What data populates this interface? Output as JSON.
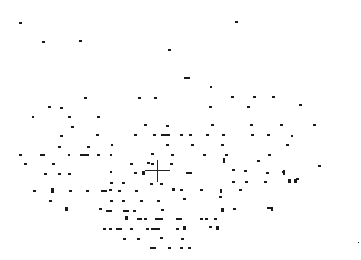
{
  "scene": {
    "background": "#ffffff",
    "mark_color": "#1a1a1a",
    "crosshair": {
      "x": 157,
      "y": 170,
      "arm": 12
    },
    "marks": [
      [
        19,
        22,
        3,
        2
      ],
      [
        42,
        41,
        3,
        2
      ],
      [
        79,
        40,
        3,
        2
      ],
      [
        235,
        21,
        3,
        2
      ],
      [
        168,
        49,
        3,
        2
      ],
      [
        184,
        77,
        6,
        2
      ],
      [
        210,
        86,
        2,
        2
      ],
      [
        84,
        97,
        3,
        2
      ],
      [
        138,
        97,
        3,
        2
      ],
      [
        154,
        97,
        3,
        2
      ],
      [
        231,
        96,
        3,
        2
      ],
      [
        253,
        96,
        3,
        2
      ],
      [
        272,
        96,
        3,
        2
      ],
      [
        48,
        106,
        3,
        2
      ],
      [
        60,
        107,
        3,
        2
      ],
      [
        68,
        116,
        3,
        2
      ],
      [
        97,
        116,
        3,
        2
      ],
      [
        209,
        106,
        3,
        2
      ],
      [
        247,
        106,
        3,
        2
      ],
      [
        299,
        104,
        3,
        2
      ],
      [
        32,
        116,
        2,
        2
      ],
      [
        71,
        126,
        3,
        2
      ],
      [
        144,
        124,
        3,
        2
      ],
      [
        166,
        125,
        3,
        2
      ],
      [
        211,
        124,
        3,
        2
      ],
      [
        250,
        124,
        3,
        2
      ],
      [
        280,
        124,
        3,
        2
      ],
      [
        313,
        124,
        3,
        2
      ],
      [
        60,
        135,
        3,
        2
      ],
      [
        96,
        134,
        3,
        2
      ],
      [
        134,
        134,
        3,
        2
      ],
      [
        153,
        134,
        3,
        2
      ],
      [
        161,
        134,
        9,
        2
      ],
      [
        180,
        134,
        3,
        2
      ],
      [
        189,
        134,
        3,
        2
      ],
      [
        206,
        134,
        3,
        2
      ],
      [
        222,
        134,
        3,
        2
      ],
      [
        251,
        134,
        3,
        2
      ],
      [
        267,
        134,
        3,
        2
      ],
      [
        291,
        135,
        2,
        2
      ],
      [
        58,
        146,
        3,
        2
      ],
      [
        87,
        146,
        3,
        2
      ],
      [
        111,
        144,
        2,
        2
      ],
      [
        166,
        144,
        3,
        2
      ],
      [
        191,
        144,
        3,
        2
      ],
      [
        221,
        144,
        3,
        2
      ],
      [
        286,
        144,
        3,
        2
      ],
      [
        19,
        154,
        3,
        2
      ],
      [
        40,
        154,
        5,
        2
      ],
      [
        68,
        154,
        2,
        2
      ],
      [
        80,
        154,
        9,
        2
      ],
      [
        97,
        154,
        3,
        2
      ],
      [
        110,
        154,
        2,
        2
      ],
      [
        151,
        153,
        3,
        2
      ],
      [
        171,
        154,
        3,
        2
      ],
      [
        203,
        154,
        3,
        2
      ],
      [
        225,
        154,
        3,
        2
      ],
      [
        268,
        154,
        3,
        2
      ],
      [
        24,
        163,
        3,
        2
      ],
      [
        52,
        163,
        3,
        2
      ],
      [
        130,
        163,
        3,
        2
      ],
      [
        147,
        162,
        3,
        2
      ],
      [
        151,
        163,
        3,
        2
      ],
      [
        170,
        163,
        3,
        2
      ],
      [
        257,
        160,
        3,
        2
      ],
      [
        44,
        173,
        3,
        2
      ],
      [
        58,
        173,
        3,
        2
      ],
      [
        68,
        173,
        3,
        2
      ],
      [
        110,
        171,
        2,
        2
      ],
      [
        134,
        172,
        3,
        2
      ],
      [
        186,
        172,
        6,
        2
      ],
      [
        232,
        169,
        3,
        2
      ],
      [
        244,
        170,
        3,
        2
      ],
      [
        266,
        172,
        3,
        2
      ],
      [
        282,
        171,
        3,
        2
      ],
      [
        318,
        165,
        3,
        2
      ],
      [
        296,
        178,
        3,
        2
      ],
      [
        142,
        171,
        3,
        4
      ],
      [
        223,
        158,
        2,
        5
      ],
      [
        283,
        170,
        2,
        5
      ],
      [
        288,
        179,
        3,
        4
      ],
      [
        294,
        179,
        3,
        4
      ],
      [
        150,
        183,
        3,
        2
      ],
      [
        160,
        183,
        3,
        2
      ],
      [
        110,
        182,
        3,
        2
      ],
      [
        122,
        182,
        3,
        2
      ],
      [
        232,
        181,
        3,
        2
      ],
      [
        245,
        181,
        3,
        2
      ],
      [
        264,
        181,
        3,
        2
      ],
      [
        109,
        189,
        3,
        2
      ],
      [
        33,
        190,
        3,
        2
      ],
      [
        69,
        190,
        3,
        2
      ],
      [
        86,
        190,
        3,
        2
      ],
      [
        101,
        190,
        6,
        2
      ],
      [
        118,
        190,
        3,
        2
      ],
      [
        135,
        190,
        3,
        2
      ],
      [
        172,
        188,
        3,
        3
      ],
      [
        180,
        189,
        3,
        2
      ],
      [
        200,
        189,
        3,
        2
      ],
      [
        239,
        189,
        3,
        2
      ],
      [
        220,
        189,
        2,
        4
      ],
      [
        51,
        188,
        3,
        5
      ],
      [
        49,
        200,
        3,
        2
      ],
      [
        110,
        200,
        3,
        2
      ],
      [
        122,
        200,
        3,
        2
      ],
      [
        106,
        210,
        6,
        2
      ],
      [
        123,
        210,
        6,
        2
      ],
      [
        133,
        210,
        3,
        2
      ],
      [
        140,
        200,
        3,
        2
      ],
      [
        157,
        200,
        3,
        2
      ],
      [
        161,
        209,
        3,
        2
      ],
      [
        183,
        198,
        3,
        2
      ],
      [
        219,
        196,
        3,
        2
      ],
      [
        65,
        207,
        3,
        4
      ],
      [
        99,
        208,
        3,
        2
      ],
      [
        103,
        228,
        3,
        2
      ],
      [
        109,
        228,
        3,
        2
      ],
      [
        125,
        216,
        3,
        4
      ],
      [
        137,
        218,
        5,
        2
      ],
      [
        144,
        218,
        3,
        2
      ],
      [
        155,
        218,
        8,
        2
      ],
      [
        176,
        218,
        3,
        2
      ],
      [
        179,
        218,
        3,
        2
      ],
      [
        200,
        218,
        3,
        2
      ],
      [
        205,
        218,
        3,
        2
      ],
      [
        214,
        218,
        3,
        2
      ],
      [
        221,
        208,
        3,
        4
      ],
      [
        233,
        208,
        3,
        2
      ],
      [
        267,
        207,
        6,
        2
      ],
      [
        271,
        207,
        2,
        4
      ],
      [
        116,
        228,
        6,
        2
      ],
      [
        130,
        228,
        3,
        2
      ],
      [
        146,
        228,
        3,
        2
      ],
      [
        151,
        228,
        9,
        2
      ],
      [
        176,
        228,
        3,
        2
      ],
      [
        209,
        226,
        3,
        2
      ],
      [
        183,
        226,
        3,
        4
      ],
      [
        216,
        226,
        3,
        4
      ],
      [
        123,
        238,
        3,
        2
      ],
      [
        137,
        238,
        3,
        2
      ],
      [
        160,
        237,
        3,
        2
      ],
      [
        181,
        238,
        3,
        2
      ],
      [
        150,
        247,
        6,
        2
      ],
      [
        168,
        247,
        3,
        2
      ],
      [
        180,
        247,
        3,
        2
      ],
      [
        188,
        247,
        3,
        2
      ],
      [
        358,
        242,
        1,
        1
      ]
    ]
  }
}
